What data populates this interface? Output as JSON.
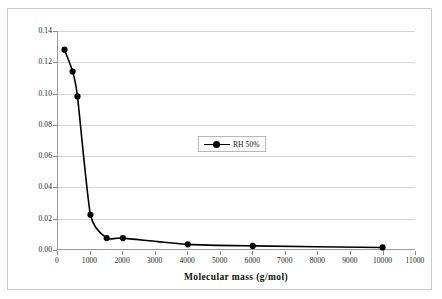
{
  "chart_data": {
    "type": "line",
    "title": "",
    "subtitle": "",
    "xlabel": "Molecular mass (g/mol)",
    "ylabel": "water content (w/w)",
    "xlim": [
      0,
      11000
    ],
    "ylim": [
      0.0,
      0.14
    ],
    "xticks": [
      0,
      1000,
      2000,
      3000,
      4000,
      5000,
      6000,
      7000,
      8000,
      9000,
      10000,
      11000
    ],
    "xtick_labels": [
      "0",
      "1000",
      "2000",
      "3000",
      "4000",
      "5000",
      "6000",
      "7000",
      "8000",
      "9000",
      "10000",
      "11000"
    ],
    "yticks": [
      0.0,
      0.02,
      0.04,
      0.06,
      0.08,
      0.1,
      0.12,
      0.14
    ],
    "ytick_labels": [
      "0.00",
      "0.02",
      "0.04",
      "0.06",
      "0.08",
      "0.10",
      "0.12",
      "0.14"
    ],
    "grid": "horizontal",
    "legend_position": "center",
    "marker": "filled-circle",
    "line_color": "#000000",
    "marker_color": "#000000",
    "series": [
      {
        "name": "RH 50%",
        "x": [
          200,
          450,
          600,
          1000,
          1500,
          2000,
          4000,
          6000,
          10000
        ],
        "y": [
          0.128,
          0.114,
          0.098,
          0.022,
          0.007,
          0.007,
          0.003,
          0.002,
          0.001
        ]
      }
    ]
  },
  "legend": {
    "entries": [
      {
        "label": "RH 50%"
      }
    ]
  },
  "axes": {
    "y_axis_label": "water content (w/w)",
    "x_axis_label": "Molecular mass (g/mol)"
  }
}
